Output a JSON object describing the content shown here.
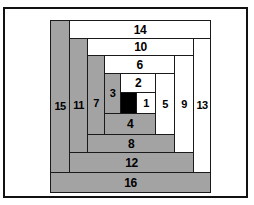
{
  "diagram": {
    "type": "log-cabin-block",
    "canvas": {
      "width": 254,
      "height": 205
    },
    "frame": {
      "x": 3,
      "y": 7,
      "width": 245,
      "height": 191,
      "border_color": "#111111"
    },
    "colors": {
      "light": "#ffffff",
      "dark": "#a3a3a3",
      "center": "#000000",
      "outline": "#1a1a1a",
      "background": "#ffffff"
    },
    "pieces": [
      {
        "label": "",
        "name": "center-square",
        "shade": "center",
        "x": 120,
        "y": 92,
        "w": 17,
        "h": 22
      },
      {
        "label": "1",
        "name": "log-1",
        "shade": "light",
        "x": 136,
        "y": 92,
        "w": 20,
        "h": 22
      },
      {
        "label": "2",
        "name": "log-2",
        "shade": "light",
        "x": 120,
        "y": 73,
        "w": 36,
        "h": 20
      },
      {
        "label": "3",
        "name": "log-3",
        "shade": "dark",
        "x": 104,
        "y": 73,
        "w": 17,
        "h": 41
      },
      {
        "label": "4",
        "name": "log-4",
        "shade": "dark",
        "x": 104,
        "y": 113,
        "w": 52,
        "h": 22
      },
      {
        "label": "5",
        "name": "log-5",
        "shade": "light",
        "x": 155,
        "y": 73,
        "w": 20,
        "h": 62
      },
      {
        "label": "6",
        "name": "log-6",
        "shade": "light",
        "x": 104,
        "y": 55,
        "w": 71,
        "h": 19
      },
      {
        "label": "7",
        "name": "log-7",
        "shade": "dark",
        "x": 87,
        "y": 55,
        "w": 18,
        "h": 97
      },
      {
        "label": "8",
        "name": "log-8",
        "shade": "dark",
        "x": 87,
        "y": 134,
        "w": 88,
        "h": 19
      },
      {
        "label": "9",
        "name": "log-9",
        "shade": "light",
        "x": 174,
        "y": 55,
        "w": 20,
        "h": 98
      },
      {
        "label": "10",
        "name": "log-10",
        "shade": "light",
        "x": 87,
        "y": 38,
        "w": 107,
        "h": 18
      },
      {
        "label": "11",
        "name": "log-11",
        "shade": "dark",
        "x": 69,
        "y": 38,
        "w": 19,
        "h": 134
      },
      {
        "label": "12",
        "name": "log-12",
        "shade": "dark",
        "x": 69,
        "y": 152,
        "w": 125,
        "h": 21
      },
      {
        "label": "13",
        "name": "log-13",
        "shade": "light",
        "x": 193,
        "y": 38,
        "w": 18,
        "h": 135
      },
      {
        "label": "14",
        "name": "log-14",
        "shade": "light",
        "x": 69,
        "y": 20,
        "w": 142,
        "h": 19
      },
      {
        "label": "15",
        "name": "log-15",
        "shade": "dark",
        "x": 50,
        "y": 20,
        "w": 20,
        "h": 172
      },
      {
        "label": "16",
        "name": "log-16",
        "shade": "dark",
        "x": 50,
        "y": 172,
        "w": 161,
        "h": 21
      }
    ]
  }
}
